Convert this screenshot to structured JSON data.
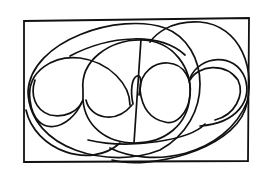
{
  "figure": {
    "width": 261,
    "height": 176,
    "background": "#ffffff",
    "stroke_color": "#111111",
    "frame": {
      "points": "24,21 249,18 248,161 24,162"
    },
    "curves": [
      {
        "name": "large-left-ellipse",
        "d": "M 28 92 C 30 40, 120 12, 165 28 C 210 45, 215 120, 160 150 C 110 170, 30 150, 28 92 Z"
      },
      {
        "name": "large-right-ellipse",
        "d": "M 112 160 C 150 170, 230 150, 245 110 C 258 70, 240 25, 200 22 C 170 20, 155 35, 150 42"
      },
      {
        "name": "inner-band-upper",
        "d": "M 70 56 C 110 35, 160 32, 185 55"
      },
      {
        "name": "inner-band-lower",
        "d": "M 88 140 C 130 150, 190 140, 205 124"
      },
      {
        "name": "left-heart-outer",
        "d": "M 82 102 C 70 130, 35 140, 30 100 C 26 70, 55 55, 80 58 C 110 62, 130 85, 130 105"
      },
      {
        "name": "left-heart-inner",
        "d": "M 83 100 C 78 112, 65 118, 50 115 C 35 110, 30 95, 35 80"
      },
      {
        "name": "left-lower-arc",
        "d": "M 26 110 C 35 150, 90 170, 120 143"
      },
      {
        "name": "center-circle",
        "d": "M 83 90 C 80 60, 110 40, 140 40 C 175 40, 192 70, 190 95 C 188 125, 165 143, 135 143 C 105 143, 85 125, 83 100 Z"
      },
      {
        "name": "center-left-lobe",
        "d": "M 86 100 C 90 118, 115 125, 132 105"
      },
      {
        "name": "small-loop",
        "d": "M 133 104 C 130 90, 132 78, 137 76 C 142 74, 141 85, 139 95"
      },
      {
        "name": "center-right-circle",
        "d": "M 140 90 C 140 72, 155 62, 168 63 C 185 64, 192 80, 190 95 C 188 115, 175 125, 165 122 C 150 119, 142 108, 140 90"
      },
      {
        "name": "right-heart-outer",
        "d": "M 190 78 C 200 55, 235 52, 245 78 C 252 100, 238 123, 200 126"
      },
      {
        "name": "right-heart-inner",
        "d": "M 190 80 C 198 65, 225 62, 238 80 C 245 95, 235 115, 215 120"
      },
      {
        "name": "bottom-sweep",
        "d": "M 110 148 C 150 168, 225 158, 248 100"
      },
      {
        "name": "vertical-line",
        "d": "M 141 39 L 134 143"
      }
    ]
  }
}
